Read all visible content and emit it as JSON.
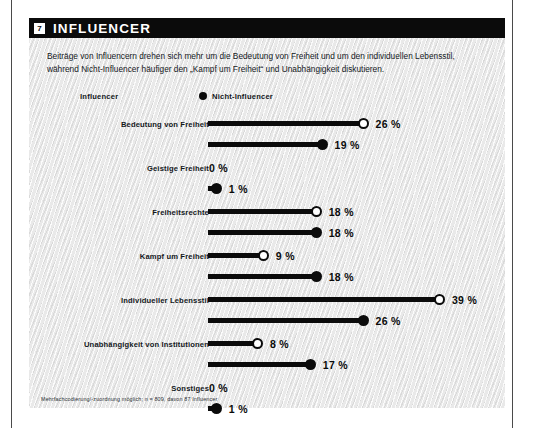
{
  "page": {
    "background": "#ffffff",
    "accent": "#0b0b0b",
    "panel_background": "#e9e9e9"
  },
  "header": {
    "badge": "7",
    "title": "INFLUENCER"
  },
  "intro": {
    "text": "Beiträge von Influencern drehen sich mehr um die Bedeutung von Freiheit und um den individuellen Lebensstil, während Nicht-Influencer häufiger den „Kampf um Freiheit“ und Unabhängigkeit diskutieren."
  },
  "legend": {
    "items": [
      {
        "label": "Influencer",
        "marker": "hollow-circle-icon"
      },
      {
        "label": "Nicht-Influencer",
        "marker": "filled-circle-icon"
      }
    ]
  },
  "footnote": {
    "text": "Mehrfachcodierung/-zuordnung möglich; n = 809, davon 87 Influencer"
  },
  "chart_data": {
    "type": "bar",
    "title": "INFLUENCER",
    "xlabel": "",
    "ylabel": "",
    "xlim": [
      0,
      39
    ],
    "grid": false,
    "legend_position": "top",
    "categories": [
      "Bedeutung von Freiheit",
      "Geistige Freiheit",
      "Freiheitsrechte",
      "Kampf um Freiheit",
      "Individueller Lebensstil",
      "Unabhängigkeit von Institutionen",
      "Sonstiges"
    ],
    "series": [
      {
        "name": "Influencer",
        "marker": "hollow-circle-icon",
        "values": [
          26,
          0,
          18,
          9,
          39,
          8,
          0
        ],
        "labels": [
          "26 %",
          "0 %",
          "18 %",
          "9 %",
          "39 %",
          "8 %",
          "0 %"
        ]
      },
      {
        "name": "Nicht-Influencer",
        "marker": "filled-circle-icon",
        "values": [
          19,
          1,
          18,
          18,
          26,
          17,
          1
        ],
        "labels": [
          "19 %",
          "1 %",
          "18 %",
          "18 %",
          "26 %",
          "17 %",
          "1 %"
        ]
      }
    ]
  }
}
